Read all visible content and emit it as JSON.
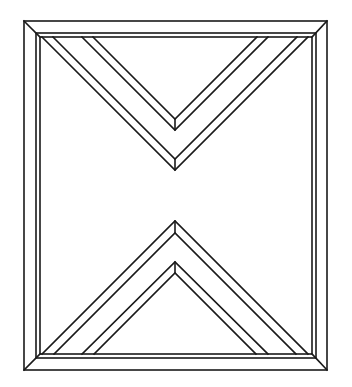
{
  "diagram": {
    "stroke_color": "#1a1a1a",
    "background": "#ffffff",
    "outer_frame": {
      "x1": 24,
      "y1": 21,
      "x2": 327,
      "y2": 370
    },
    "inner_frame_a": {
      "x1": 36,
      "y1": 33,
      "x2": 316,
      "y2": 358
    },
    "inner_frame_b": {
      "x1": 40,
      "y1": 37,
      "x2": 312,
      "y2": 354
    },
    "top_chevron": {
      "outer_apex": [
        175,
        171
      ],
      "outer_apex_inner": [
        175,
        159
      ],
      "inner_apex": [
        175,
        130
      ],
      "inner_apex_inner": [
        175,
        119
      ]
    },
    "bottom_chevron": {
      "outer_apex": [
        175,
        222
      ],
      "outer_apex_inner": [
        175,
        234
      ],
      "inner_apex": [
        175,
        263
      ],
      "inner_apex_inner": [
        175,
        273
      ]
    }
  }
}
